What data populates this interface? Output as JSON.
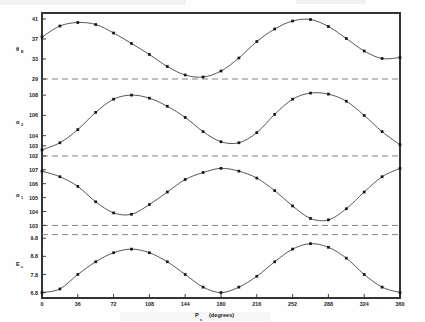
{
  "chart_data": {
    "type": "line",
    "title": "",
    "subtitle": "",
    "xlabel": "P",
    "xlabel_sub": "s",
    "xlabel_units": "(degrees)",
    "xlim": [
      0,
      360
    ],
    "xticks": [
      0,
      36,
      72,
      108,
      144,
      180,
      216,
      252,
      288,
      324,
      360
    ],
    "xticklabels": [
      "0",
      "36",
      "72",
      "108",
      "144",
      "180",
      "216",
      "252",
      "288",
      "324",
      "360"
    ],
    "grid": false,
    "legend": "none",
    "markers": "filled-square",
    "panels": [
      {
        "name": "panel-theta-E",
        "ylabel": "θ",
        "ylabel_sub": "E",
        "ylim": [
          27.6,
          42.2
        ],
        "yticks": [
          41,
          37,
          33,
          29
        ],
        "yticklabels": [
          "41",
          "37",
          "33",
          "29"
        ],
        "refline": 29,
        "x": [
          0,
          18,
          36,
          54,
          72,
          90,
          108,
          126,
          144,
          162,
          180,
          198,
          216,
          234,
          252,
          270,
          288,
          306,
          324,
          342,
          360
        ],
        "y": [
          37.4,
          39.6,
          40.3,
          39.9,
          38.2,
          36.1,
          33.9,
          31.5,
          29.8,
          29.4,
          30.6,
          33.2,
          36.5,
          39.0,
          40.6,
          40.9,
          39.5,
          37.1,
          34.6,
          33.1,
          33.3
        ]
      },
      {
        "name": "panel-alpha-2",
        "ylabel": "α",
        "ylabel_sub": "2",
        "ylim": [
          101.6,
          108.9
        ],
        "yticks": [
          108,
          106,
          104,
          103,
          102
        ],
        "yticklabels": [
          "108",
          "106",
          "104",
          "103",
          "102"
        ],
        "refline": 102,
        "x": [
          0,
          18,
          36,
          54,
          72,
          90,
          108,
          126,
          144,
          162,
          180,
          198,
          216,
          234,
          252,
          270,
          288,
          306,
          324,
          342,
          360
        ],
        "y": [
          102.6,
          103.3,
          104.6,
          106.3,
          107.6,
          108.0,
          107.7,
          106.9,
          105.8,
          104.4,
          103.4,
          103.3,
          104.3,
          106.1,
          107.6,
          108.2,
          108.1,
          107.4,
          106.0,
          104.4,
          103.1
        ]
      },
      {
        "name": "panel-alpha-1",
        "ylabel": "α",
        "ylabel_sub": "1",
        "ylim": [
          102.6,
          107.7
        ],
        "yticks": [
          107,
          106,
          105,
          104,
          103
        ],
        "yticklabels": [
          "107",
          "106",
          "105",
          "104",
          "103"
        ],
        "refline": 103,
        "x": [
          0,
          18,
          36,
          54,
          72,
          90,
          108,
          126,
          144,
          162,
          180,
          198,
          216,
          234,
          252,
          270,
          288,
          306,
          324,
          342,
          360
        ],
        "y": [
          106.9,
          106.5,
          105.8,
          104.7,
          103.9,
          103.8,
          104.5,
          105.4,
          106.3,
          106.8,
          107.1,
          106.9,
          106.4,
          105.5,
          104.4,
          103.5,
          103.4,
          104.2,
          105.4,
          106.5,
          107.1
        ]
      },
      {
        "name": "panel-E-c",
        "ylabel": "E",
        "ylabel_sub": "c",
        "ylim": [
          6.5,
          10.2
        ],
        "yticks": [
          9.8,
          8.8,
          7.8,
          6.8
        ],
        "yticklabels": [
          "9.8",
          "8.8",
          "7.8",
          "6.8"
        ],
        "refline": 10.0,
        "x": [
          0,
          18,
          36,
          54,
          72,
          90,
          108,
          126,
          144,
          162,
          180,
          198,
          216,
          234,
          252,
          270,
          288,
          306,
          324,
          342,
          360
        ],
        "y": [
          6.8,
          7.0,
          7.8,
          8.5,
          9.0,
          9.2,
          9.0,
          8.5,
          7.8,
          7.1,
          6.8,
          7.1,
          7.7,
          8.5,
          9.2,
          9.5,
          9.3,
          8.7,
          7.8,
          7.1,
          6.8
        ]
      }
    ]
  },
  "colors": {
    "frame": "#2b2b2b",
    "curve": "#3a3a3a",
    "marker": "#151515",
    "refline": "#777777",
    "background": "#fefefe"
  }
}
